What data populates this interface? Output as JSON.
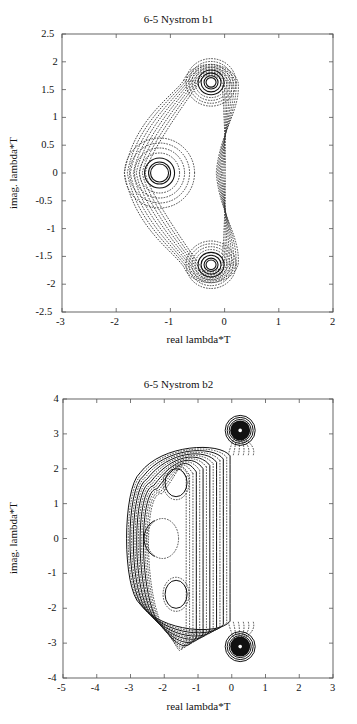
{
  "chart_data": [
    {
      "type": "contour",
      "title": "6-5 Nystrom b1",
      "xlabel": "real lambda*T",
      "ylabel": "imag. lambda*T",
      "xlim": [
        -3,
        2
      ],
      "ylim": [
        -2.5,
        2.5
      ],
      "xticks": [
        "-3",
        "-2",
        "-1",
        "0",
        "1",
        "2"
      ],
      "yticks": [
        "2.5",
        "2",
        "1.5",
        "1",
        "0.5",
        "0",
        "-0.5",
        "-1",
        "-1.5",
        "-2",
        "-2.5"
      ],
      "grid": false,
      "poles": [
        {
          "x": -1.2,
          "y": 0.0
        },
        {
          "x": -0.25,
          "y": 1.63
        },
        {
          "x": -0.25,
          "y": -1.65
        }
      ],
      "outer_boundary_extent": {
        "xmin": -1.85,
        "xmax": 0.25,
        "ymin": -2.05,
        "ymax": 2.05
      },
      "line_styles": "solid inner contours near poles, dotted outer contours"
    },
    {
      "type": "contour",
      "title": "6-5 Nystrom b2",
      "xlabel": "real lambda*T",
      "ylabel": "imag. lambda*T",
      "xlim": [
        -5,
        3
      ],
      "ylim": [
        -4,
        4
      ],
      "xticks": [
        "-5",
        "-4",
        "-3",
        "-2",
        "-1",
        "0",
        "1",
        "2",
        "3"
      ],
      "yticks": [
        "4",
        "3",
        "2",
        "1",
        "0",
        "-1",
        "-2",
        "-3",
        "-4"
      ],
      "grid": false,
      "poles": [
        {
          "x": 0.25,
          "y": 3.1
        },
        {
          "x": 0.25,
          "y": -3.1
        }
      ],
      "inner_regions": [
        {
          "x": -1.65,
          "y": 1.6
        },
        {
          "x": -2.05,
          "y": 0.0
        },
        {
          "x": -1.65,
          "y": -1.6
        }
      ],
      "outer_boundary_extent": {
        "xmin": -3.25,
        "xmax": 0.55,
        "ymin": -3.4,
        "ymax": 3.4
      },
      "line_styles": "solid contours on left arcs, dotted contours on right"
    }
  ]
}
